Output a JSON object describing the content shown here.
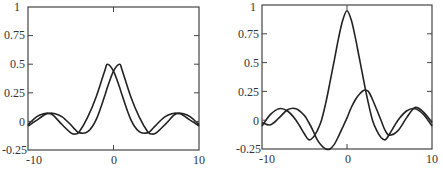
{
  "chart_data": [
    {
      "type": "line",
      "title": "",
      "xlabel": "",
      "ylabel": "",
      "xlim": [
        -10,
        10
      ],
      "ylim": [
        -0.25,
        1
      ],
      "grid": false,
      "legend": null,
      "x_ticks": [
        "-10",
        "0",
        "10"
      ],
      "y_ticks": [
        "1",
        "0.75",
        "0.5",
        "0.25",
        "0",
        "-0.25"
      ],
      "x": [
        -10,
        -9,
        -8,
        -7.5,
        -7,
        -6,
        -5,
        -4.5,
        -4,
        -3,
        -2,
        -1,
        -0.7,
        0,
        0.7,
        1,
        2,
        3,
        4,
        4.5,
        5,
        6,
        7,
        7.5,
        8,
        9,
        10
      ],
      "series": [
        {
          "name": "curve-left-shift",
          "values": [
            -0.03,
            0.04,
            0.07,
            0.07,
            0.05,
            -0.03,
            -0.1,
            -0.11,
            -0.09,
            0.04,
            0.22,
            0.45,
            0.5,
            0.44,
            0.3,
            0.23,
            0.02,
            -0.09,
            -0.1,
            -0.07,
            -0.03,
            0.04,
            0.07,
            0.07,
            0.06,
            0.01,
            -0.04
          ]
        },
        {
          "name": "curve-right-shift",
          "values": [
            -0.04,
            0.01,
            0.06,
            0.07,
            0.07,
            0.04,
            -0.03,
            -0.07,
            -0.1,
            -0.09,
            0.02,
            0.23,
            0.3,
            0.44,
            0.5,
            0.45,
            0.22,
            0.04,
            -0.09,
            -0.11,
            -0.1,
            -0.03,
            0.05,
            0.07,
            0.07,
            0.04,
            -0.03
          ]
        }
      ],
      "frame": {
        "left": 28,
        "top": 7,
        "right": 199,
        "bottom": 150
      }
    },
    {
      "type": "line",
      "title": "",
      "xlabel": "",
      "ylabel": "",
      "xlim": [
        -10,
        10
      ],
      "ylim": [
        -0.25,
        1
      ],
      "grid": false,
      "legend": null,
      "x_ticks": [
        "-10",
        "0",
        "10"
      ],
      "y_ticks": [
        "1",
        "0.75",
        "0.5",
        "0.25",
        "0",
        "-0.25"
      ],
      "x": [
        -10,
        -9,
        -8,
        -7,
        -6,
        -5,
        -4.5,
        -4,
        -3.5,
        -3,
        -2.5,
        -2,
        -1.5,
        -1,
        -0.5,
        0,
        0.5,
        1,
        1.5,
        2,
        2.5,
        3,
        3.5,
        4,
        4.5,
        5,
        6,
        7,
        8,
        9,
        10
      ],
      "series": [
        {
          "name": "central-peak",
          "values": [
            -0.05,
            0.05,
            0.1,
            0.08,
            0.0,
            -0.12,
            -0.17,
            -0.15,
            -0.09,
            0.0,
            0.15,
            0.33,
            0.52,
            0.71,
            0.87,
            0.95,
            0.87,
            0.71,
            0.52,
            0.33,
            0.15,
            0.0,
            -0.09,
            -0.15,
            -0.17,
            -0.12,
            0.0,
            0.08,
            0.1,
            0.05,
            -0.05
          ]
        },
        {
          "name": "odd-component",
          "values": [
            -0.02,
            -0.04,
            0.02,
            0.09,
            0.1,
            0.04,
            -0.02,
            -0.09,
            -0.17,
            -0.22,
            -0.25,
            -0.25,
            -0.21,
            -0.14,
            -0.06,
            0.02,
            0.11,
            0.18,
            0.23,
            0.26,
            0.25,
            0.18,
            0.09,
            0.0,
            -0.09,
            -0.13,
            -0.09,
            0.02,
            0.11,
            0.07,
            -0.02
          ]
        }
      ],
      "frame": {
        "left": 262,
        "top": 5,
        "right": 432,
        "bottom": 149
      }
    }
  ],
  "charts": [
    {
      "y_ticks": [
        "1",
        "0.75",
        "0.5",
        "0.25",
        "0",
        "-0.25"
      ],
      "x_ticks": [
        "-10",
        "0",
        "10"
      ]
    },
    {
      "y_ticks": [
        "1",
        "0.75",
        "0.5",
        "0.25",
        "0",
        "-0.25"
      ],
      "x_ticks": [
        "-10",
        "0",
        "10"
      ]
    }
  ],
  "colors": {
    "line": "#222222",
    "frame": "#444444",
    "text": "#333333",
    "background": "#ffffff"
  }
}
